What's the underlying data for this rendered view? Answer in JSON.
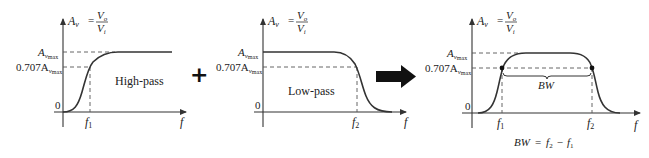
{
  "panels": [
    {
      "id": "high-pass",
      "ylabel_main": "A",
      "ylabel_sub": "v",
      "ylabel_eq": "=",
      "ylabel_num": "V",
      "ylabel_num_sub": "o",
      "ylabel_den": "V",
      "ylabel_den_sub": "i",
      "amax_main": "A",
      "amax_sub": "v",
      "amax_subsub": "max",
      "half_prefix": "0.707A",
      "half_sub": "v",
      "half_subsub": "max",
      "zero": "0",
      "freq_marker": "f",
      "freq_marker_sub": "1",
      "xlabel": "f",
      "caption": "High-pass"
    },
    {
      "id": "low-pass",
      "ylabel_main": "A",
      "ylabel_sub": "v",
      "ylabel_eq": "=",
      "ylabel_num": "V",
      "ylabel_num_sub": "o",
      "ylabel_den": "V",
      "ylabel_den_sub": "i",
      "amax_main": "A",
      "amax_sub": "v",
      "amax_subsub": "max",
      "half_prefix": "0.707A",
      "half_sub": "v",
      "half_subsub": "max",
      "zero": "0",
      "freq_marker": "f",
      "freq_marker_sub": "2",
      "xlabel": "f",
      "caption": "Low-pass"
    },
    {
      "id": "band-pass",
      "ylabel_main": "A",
      "ylabel_sub": "v",
      "ylabel_eq": "=",
      "ylabel_num": "V",
      "ylabel_num_sub": "o",
      "ylabel_den": "V",
      "ylabel_den_sub": "i",
      "amax_main": "A",
      "amax_sub": "v",
      "amax_subsub": "max",
      "half_prefix": "0.707A",
      "half_sub": "v",
      "half_subsub": "max",
      "zero": "0",
      "f1": "f",
      "f1_sub": "1",
      "f2": "f",
      "f2_sub": "2",
      "xlabel": "f",
      "bw_label": "BW",
      "formula_lhs": "BW",
      "formula_eq": "=",
      "formula_f2": "f",
      "formula_f2_sub": "2",
      "formula_minus": "−",
      "formula_f1": "f",
      "formula_f1_sub": "1"
    }
  ],
  "operators": {
    "plus": "+",
    "arrow": "right-arrow"
  },
  "colors": {
    "ink": "#222222",
    "axis": "#333333",
    "dash": "#555555",
    "background": "#ffffff"
  }
}
